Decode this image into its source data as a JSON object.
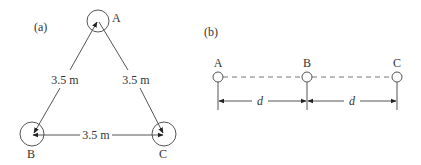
{
  "panel_a": {
    "label": "(a)",
    "nodes": [
      {
        "id": "A",
        "label": "A",
        "cx": 98,
        "cy": 21
      },
      {
        "id": "B",
        "label": "B",
        "cx": 32,
        "cy": 134
      },
      {
        "id": "C",
        "label": "C",
        "cx": 164,
        "cy": 134
      }
    ],
    "edges": [
      {
        "from": "A",
        "to": "B",
        "label": "3.5 m"
      },
      {
        "from": "A",
        "to": "C",
        "label": "3.5 m"
      },
      {
        "from": "B",
        "to": "C",
        "label": "3.5 m"
      }
    ]
  },
  "panel_b": {
    "label": "(b)",
    "nodes": [
      {
        "id": "A",
        "label": "A",
        "cx": 218
      },
      {
        "id": "B",
        "label": "B",
        "cx": 307
      },
      {
        "id": "C",
        "label": "C",
        "cx": 397
      }
    ],
    "spacings": [
      {
        "label": "d"
      },
      {
        "label": "d"
      }
    ]
  },
  "colors": {
    "stroke": "#555555",
    "text": "#333333",
    "dash": "#777777"
  }
}
